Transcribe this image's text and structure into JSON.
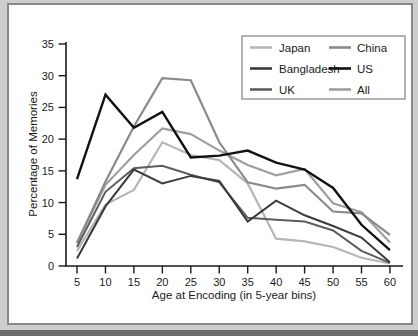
{
  "figure": {
    "matte_color": "#cdcdcd",
    "frame_border_color": "#878787",
    "panel_color": "#ffffff",
    "bottom_strip_color": "#6d6d6d",
    "axis_color": "#1a1a1a",
    "text_color": "#1a1a1a",
    "legend_border_color": "#8a8a8a"
  },
  "chart_data": {
    "type": "line",
    "title": "",
    "xlabel": "Age at Encoding (in 5-year bins)",
    "ylabel": "Percentage of Memories",
    "x": [
      5,
      10,
      15,
      20,
      25,
      30,
      35,
      40,
      45,
      50,
      55,
      60
    ],
    "xlim": [
      5,
      60
    ],
    "ylim": [
      0,
      35
    ],
    "yticks": [
      0,
      5,
      10,
      15,
      20,
      25,
      30,
      35
    ],
    "grid": false,
    "legend_position": "top-right",
    "legend_columns": [
      [
        "Japan",
        "Bangladesh",
        "UK"
      ],
      [
        "China",
        "US",
        "All"
      ]
    ],
    "draw_order": [
      "Japan",
      "All",
      "China",
      "UK",
      "Bangladesh",
      "US"
    ],
    "series": [
      {
        "name": "Japan",
        "color": "#b6b6b6",
        "width": 2.2,
        "values": [
          2.4,
          9.7,
          12.0,
          19.5,
          17.5,
          16.7,
          13.0,
          4.3,
          3.9,
          3.0,
          1.3,
          0.4
        ]
      },
      {
        "name": "Bangladesh",
        "color": "#3b3b3b",
        "width": 2.0,
        "values": [
          1.2,
          9.4,
          15.2,
          13.0,
          14.2,
          13.4,
          7.0,
          10.3,
          8.0,
          6.3,
          4.5,
          0.6
        ]
      },
      {
        "name": "UK",
        "color": "#5d5d5d",
        "width": 2.0,
        "values": [
          3.0,
          11.7,
          15.4,
          15.8,
          14.4,
          13.2,
          7.6,
          7.3,
          7.0,
          5.6,
          2.4,
          0.5
        ]
      },
      {
        "name": "China",
        "color": "#8a8a8a",
        "width": 2.2,
        "values": [
          3.6,
          13.3,
          22.0,
          29.6,
          29.3,
          19.5,
          13.2,
          12.2,
          12.8,
          8.6,
          8.3,
          4.9
        ]
      },
      {
        "name": "US",
        "color": "#121212",
        "width": 2.4,
        "values": [
          13.7,
          27.0,
          21.8,
          24.3,
          17.1,
          17.4,
          18.2,
          16.3,
          15.2,
          12.3,
          6.5,
          2.5
        ]
      },
      {
        "name": "All",
        "color": "#9f9f9f",
        "width": 2.2,
        "values": [
          3.7,
          12.8,
          17.5,
          21.7,
          20.8,
          18.2,
          15.9,
          14.3,
          15.3,
          9.9,
          8.5,
          3.7
        ]
      }
    ]
  }
}
